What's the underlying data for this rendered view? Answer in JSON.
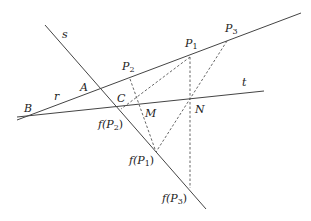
{
  "diagram": {
    "type": "projective-geometry-construction",
    "lines": [
      {
        "id": "s",
        "label": "s",
        "style": "solid",
        "from": [
          45,
          25
        ],
        "to": [
          206,
          209
        ],
        "label_pos": [
          62,
          38
        ]
      },
      {
        "id": "r",
        "label": "r",
        "style": "solid",
        "from": [
          17,
          120
        ],
        "to": [
          301,
          13
        ],
        "label_pos": [
          54,
          100
        ]
      },
      {
        "id": "t",
        "label": "t",
        "style": "solid",
        "from": [
          17,
          117
        ],
        "to": [
          264,
          91
        ],
        "label_pos": [
          242,
          86
        ]
      }
    ],
    "points": [
      {
        "id": "A",
        "label": "A",
        "pos": [
          99,
          88
        ],
        "label_pos": [
          80,
          91
        ]
      },
      {
        "id": "B",
        "label": "B",
        "pos": [
          34,
          114
        ],
        "label_pos": [
          24,
          112
        ]
      },
      {
        "id": "C",
        "label": "C",
        "pos": [
          118,
          106
        ],
        "label_pos": [
          117,
          102
        ]
      },
      {
        "id": "M",
        "label": "M",
        "pos": [
          138,
          103
        ],
        "label_pos": [
          145,
          117
        ]
      },
      {
        "id": "N",
        "label": "N",
        "pos": [
          190,
          97
        ],
        "label_pos": [
          195,
          113
        ]
      },
      {
        "id": "P1",
        "label": "P",
        "sub": "1",
        "pos": [
          190,
          57
        ],
        "label_pos": [
          185,
          47
        ]
      },
      {
        "id": "P2",
        "label": "P",
        "sub": "2",
        "pos": [
          130,
          79
        ],
        "label_pos": [
          122,
          70
        ]
      },
      {
        "id": "P3",
        "label": "P",
        "sub": "3",
        "pos": [
          227,
          41
        ],
        "label_pos": [
          225,
          32
        ]
      },
      {
        "id": "fP2",
        "label": "f(P",
        "sub": "2",
        "close": ")",
        "pos": [
          121,
          109
        ],
        "label_pos": [
          98,
          128
        ]
      },
      {
        "id": "fP1",
        "label": "f(P",
        "sub": "1",
        "close": ")",
        "pos": [
          156,
          152
        ],
        "label_pos": [
          129,
          164
        ]
      },
      {
        "id": "fP3",
        "label": "f(P",
        "sub": "3",
        "close": ")",
        "pos": [
          190,
          188
        ],
        "label_pos": [
          162,
          202
        ]
      }
    ],
    "dashed_segments": [
      {
        "from": [
          130,
          79
        ],
        "to": [
          156,
          152
        ]
      },
      {
        "from": [
          190,
          57
        ],
        "to": [
          121,
          109
        ]
      },
      {
        "from": [
          190,
          57
        ],
        "to": [
          190,
          188
        ]
      },
      {
        "from": [
          227,
          41
        ],
        "to": [
          156,
          152
        ]
      }
    ],
    "colors": {
      "line": "#444444",
      "dash": "#555555",
      "text": "#222222",
      "background": "#ffffff"
    }
  }
}
